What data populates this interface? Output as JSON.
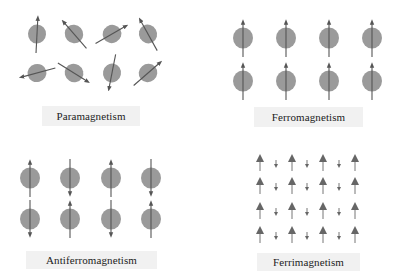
{
  "colors": {
    "background": "#ffffff",
    "atom": "#9a9a9a",
    "arrow": "#555555",
    "label_bg": "#f1f1f1",
    "label_text": "#222222"
  },
  "panels": [
    {
      "id": "paramagnetism",
      "label": "Paramagnetism",
      "label_box": {
        "x": 42,
        "y": 106,
        "w": 98,
        "h": 20
      },
      "type": "atoms",
      "atom_radius": 9,
      "arrow_length": 38,
      "atoms": [
        {
          "x": 37,
          "y": 34,
          "angle": 3
        },
        {
          "x": 74,
          "y": 34,
          "angle": -41
        },
        {
          "x": 112,
          "y": 34,
          "angle": 60
        },
        {
          "x": 148,
          "y": 34,
          "angle": -29
        },
        {
          "x": 37,
          "y": 73,
          "angle": -105
        },
        {
          "x": 74,
          "y": 73,
          "angle": 122
        },
        {
          "x": 112,
          "y": 73,
          "angle": 191
        },
        {
          "x": 148,
          "y": 73,
          "angle": 49
        }
      ]
    },
    {
      "id": "ferromagnetism",
      "label": "Ferromagnetism",
      "label_box": {
        "x": 254,
        "y": 107,
        "w": 109,
        "h": 20
      },
      "type": "atoms",
      "atom_radius": 10,
      "arrow_length": 38,
      "atoms": [
        {
          "x": 243,
          "y": 38,
          "angle": 0
        },
        {
          "x": 286,
          "y": 38,
          "angle": 0
        },
        {
          "x": 329,
          "y": 38,
          "angle": 0
        },
        {
          "x": 372,
          "y": 38,
          "angle": 0
        },
        {
          "x": 243,
          "y": 81,
          "angle": 0
        },
        {
          "x": 286,
          "y": 81,
          "angle": 0
        },
        {
          "x": 329,
          "y": 81,
          "angle": 0
        },
        {
          "x": 372,
          "y": 81,
          "angle": 0
        }
      ]
    },
    {
      "id": "antiferromagnetism",
      "label": "Antiferromagnetism",
      "label_box": {
        "x": 26,
        "y": 251,
        "w": 131,
        "h": 18
      },
      "type": "atoms",
      "atom_radius": 10,
      "arrow_length": 38,
      "atoms": [
        {
          "x": 30,
          "y": 178,
          "angle": 0
        },
        {
          "x": 70,
          "y": 178,
          "angle": 180
        },
        {
          "x": 111,
          "y": 178,
          "angle": 0
        },
        {
          "x": 151,
          "y": 178,
          "angle": 180
        },
        {
          "x": 30,
          "y": 219,
          "angle": 180
        },
        {
          "x": 70,
          "y": 219,
          "angle": 0
        },
        {
          "x": 111,
          "y": 219,
          "angle": 180
        },
        {
          "x": 151,
          "y": 219,
          "angle": 0
        }
      ]
    },
    {
      "id": "ferrimagnetism",
      "label": "Ferrimagnetism",
      "label_box": {
        "x": 257,
        "y": 253,
        "w": 103,
        "h": 18
      },
      "type": "spins",
      "columns": [
        260,
        276,
        292,
        307,
        323,
        339,
        355
      ],
      "rows": [
        163,
        186,
        211,
        235
      ],
      "pattern": [
        "big-up",
        "small-down",
        "big-up",
        "small-down",
        "big-up",
        "small-down",
        "big-up"
      ]
    }
  ]
}
